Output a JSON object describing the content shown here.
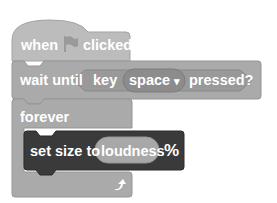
{
  "script": {
    "hat_block": {
      "label_before": "when",
      "icon": "green-flag-icon",
      "label_after": "clicked"
    },
    "wait_until_block": {
      "label": "wait until",
      "condition": {
        "label_before": "key",
        "dropdown_value": "space",
        "dropdown_arrow": "▾",
        "label_after": "pressed?"
      }
    },
    "forever_block": {
      "label": "forever",
      "loop_icon": "loop-arrow-icon",
      "body": [
        {
          "label": "set size to",
          "reporter_value": "loudness",
          "suffix": "%"
        }
      ]
    }
  },
  "colors": {
    "hat": "#bcbcbc",
    "control": "#aaaaaa",
    "sensing_boolean": "#999999",
    "dropdown": "#8c8c8c",
    "looks_dark": "#3a3a3a",
    "reporter": "#a8a8a8"
  }
}
